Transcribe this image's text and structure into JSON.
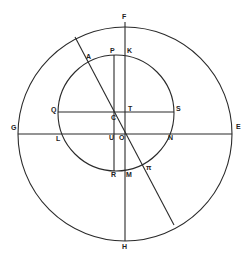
{
  "diagram": {
    "colors": {
      "stroke": "#2a2a2a",
      "label": "#222222",
      "background": "#ffffff"
    },
    "circles": [
      {
        "name": "outer-circle",
        "cx": 125,
        "cy": 134,
        "r": 107
      },
      {
        "name": "inner-circle",
        "cx": 116,
        "cy": 113,
        "r": 58
      }
    ],
    "lines": [
      {
        "name": "line-GE",
        "x1": 18,
        "y1": 134,
        "x2": 232,
        "y2": 134
      },
      {
        "name": "line-FH",
        "x1": 125,
        "y1": 22,
        "x2": 125,
        "y2": 241
      },
      {
        "name": "line-QS",
        "x1": 58,
        "y1": 112,
        "x2": 174,
        "y2": 112
      },
      {
        "name": "line-PR",
        "x1": 114,
        "y1": 55,
        "x2": 114,
        "y2": 171
      },
      {
        "name": "line-diagonal",
        "x1": 75,
        "y1": 37,
        "x2": 174,
        "y2": 225
      }
    ],
    "labels": [
      {
        "text": "F",
        "x": 122,
        "y": 19
      },
      {
        "text": "A",
        "x": 86,
        "y": 59
      },
      {
        "text": "P",
        "x": 110,
        "y": 53
      },
      {
        "text": "K",
        "x": 127,
        "y": 53
      },
      {
        "text": "Q",
        "x": 51,
        "y": 112
      },
      {
        "text": "C",
        "x": 111,
        "y": 120
      },
      {
        "text": "T",
        "x": 128,
        "y": 111
      },
      {
        "text": "S",
        "x": 176,
        "y": 111
      },
      {
        "text": "G",
        "x": 11,
        "y": 130
      },
      {
        "text": "E",
        "x": 236,
        "y": 129
      },
      {
        "text": "L",
        "x": 56,
        "y": 141
      },
      {
        "text": "U",
        "x": 109,
        "y": 140
      },
      {
        "text": "O",
        "x": 119,
        "y": 140
      },
      {
        "text": "N",
        "x": 168,
        "y": 140
      },
      {
        "text": "R",
        "x": 111,
        "y": 177
      },
      {
        "text": "M",
        "x": 126,
        "y": 177
      },
      {
        "text": "π",
        "x": 146,
        "y": 170
      },
      {
        "text": "H",
        "x": 122,
        "y": 249
      }
    ]
  }
}
